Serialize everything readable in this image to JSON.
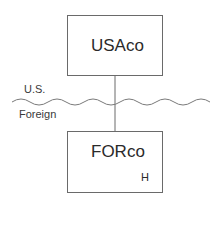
{
  "diagram": {
    "parent_entity": {
      "label": "USAco"
    },
    "subsidiary_entity": {
      "label": "FORco",
      "note": "H"
    },
    "border": {
      "upper_label": "U.S.",
      "lower_label": "Foreign"
    }
  },
  "colors": {
    "line": "#6a6a6a",
    "text": "#2a2a2a"
  }
}
